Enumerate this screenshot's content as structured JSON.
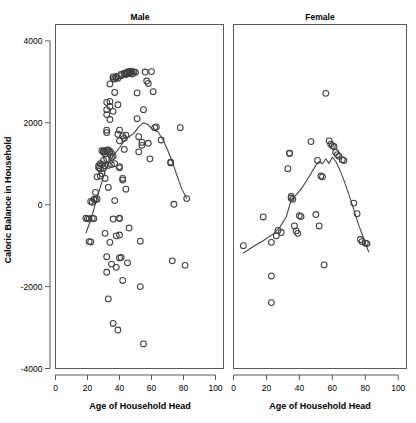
{
  "figure": {
    "background": "#ffffff",
    "ink": "#404040",
    "axis_color": "#5a5a5a",
    "ylabel": "Caloric Balance in Household",
    "panels": [
      {
        "key": "male",
        "title": "Male",
        "xlabel": "Age of Household Head"
      },
      {
        "key": "female",
        "title": "Female",
        "xlabel": "Age of Household Head"
      }
    ]
  },
  "chart_data": {
    "type": "scatter",
    "title": "",
    "xlabel": "Age of Household Head",
    "ylabel": "Caloric Balance in Household",
    "xlim": [
      0,
      105
    ],
    "ylim": [
      -4000,
      4400
    ],
    "xticks": [
      0,
      20,
      40,
      60,
      80,
      100
    ],
    "yticks": [
      4000,
      2000,
      0,
      -2000,
      -4000
    ],
    "xticklabels": [
      "0",
      "20",
      "40",
      "60",
      "80",
      "100"
    ],
    "yticklabels": [
      "4000",
      "2000",
      "0",
      "-2000",
      "-4000"
    ],
    "grid": false,
    "legend": null,
    "marker": "open-circle",
    "overlay": "loess-smoother",
    "panels": [
      {
        "name": "Male",
        "points": [
          [
            19,
            -330
          ],
          [
            20,
            -340
          ],
          [
            21,
            -350
          ],
          [
            21,
            -900
          ],
          [
            22,
            -910
          ],
          [
            22,
            80
          ],
          [
            23,
            60
          ],
          [
            23,
            -330
          ],
          [
            24,
            -340
          ],
          [
            24,
            130
          ],
          [
            25,
            300
          ],
          [
            25,
            120
          ],
          [
            26,
            140
          ],
          [
            26,
            680
          ],
          [
            27,
            900
          ],
          [
            27,
            950
          ],
          [
            28,
            870
          ],
          [
            28,
            700
          ],
          [
            28,
            1000
          ],
          [
            29,
            1320
          ],
          [
            29,
            980
          ],
          [
            29,
            760
          ],
          [
            30,
            1280
          ],
          [
            30,
            1310
          ],
          [
            30,
            900
          ],
          [
            30,
            1080
          ],
          [
            31,
            1300
          ],
          [
            31,
            1240
          ],
          [
            31,
            950
          ],
          [
            31,
            640
          ],
          [
            31,
            -700
          ],
          [
            32,
            1330
          ],
          [
            32,
            1120
          ],
          [
            32,
            1820
          ],
          [
            32,
            1760
          ],
          [
            32,
            2200
          ],
          [
            32,
            2320
          ],
          [
            32,
            2500
          ],
          [
            32,
            -1270
          ],
          [
            32,
            -1650
          ],
          [
            33,
            1340
          ],
          [
            33,
            1290
          ],
          [
            33,
            960
          ],
          [
            33,
            420
          ],
          [
            33,
            -2300
          ],
          [
            34,
            1300
          ],
          [
            34,
            2080
          ],
          [
            34,
            2400
          ],
          [
            34,
            2520
          ],
          [
            34,
            2950
          ],
          [
            34,
            -920
          ],
          [
            35,
            1260
          ],
          [
            35,
            1150
          ],
          [
            35,
            980
          ],
          [
            35,
            -1450
          ],
          [
            36,
            1180
          ],
          [
            36,
            2280
          ],
          [
            36,
            3080
          ],
          [
            36,
            3120
          ],
          [
            36,
            -350
          ],
          [
            36,
            -2900
          ],
          [
            37,
            1000
          ],
          [
            37,
            3070
          ],
          [
            37,
            2740
          ],
          [
            37,
            100
          ],
          [
            38,
            3100
          ],
          [
            38,
            3130
          ],
          [
            38,
            -760
          ],
          [
            38,
            -1530
          ],
          [
            39,
            3090
          ],
          [
            39,
            2440
          ],
          [
            39,
            1720
          ],
          [
            39,
            -3060
          ],
          [
            40,
            1560
          ],
          [
            40,
            1820
          ],
          [
            40,
            930
          ],
          [
            40,
            900
          ],
          [
            40,
            -330
          ],
          [
            40,
            -340
          ],
          [
            40,
            -1300
          ],
          [
            40,
            -740
          ],
          [
            41,
            3150
          ],
          [
            41,
            3180
          ],
          [
            41,
            -1290
          ],
          [
            42,
            1680
          ],
          [
            42,
            640
          ],
          [
            42,
            600
          ],
          [
            42,
            -1850
          ],
          [
            43,
            3190
          ],
          [
            43,
            3210
          ],
          [
            43,
            1620
          ],
          [
            43,
            1350
          ],
          [
            44,
            3180
          ],
          [
            44,
            1700
          ],
          [
            44,
            380
          ],
          [
            45,
            3240
          ],
          [
            45,
            3210
          ],
          [
            45,
            -1420
          ],
          [
            46,
            3250
          ],
          [
            46,
            3200
          ],
          [
            46,
            -570
          ],
          [
            47,
            3230
          ],
          [
            47,
            3260
          ],
          [
            48,
            3250
          ],
          [
            48,
            3190
          ],
          [
            49,
            3240
          ],
          [
            50,
            3230
          ],
          [
            51,
            2100
          ],
          [
            51,
            2730
          ],
          [
            52,
            1660
          ],
          [
            52,
            1290
          ],
          [
            53,
            -890
          ],
          [
            53,
            -2000
          ],
          [
            54,
            1520
          ],
          [
            54,
            1450
          ],
          [
            55,
            2320
          ],
          [
            55,
            -3400
          ],
          [
            56,
            3240
          ],
          [
            57,
            3020
          ],
          [
            58,
            2960
          ],
          [
            58,
            1500
          ],
          [
            59,
            1120
          ],
          [
            60,
            3250
          ],
          [
            61,
            2760
          ],
          [
            62,
            1880
          ],
          [
            63,
            1900
          ],
          [
            66,
            1580
          ],
          [
            72,
            1040
          ],
          [
            72,
            1020
          ],
          [
            73,
            -1370
          ],
          [
            74,
            10
          ],
          [
            78,
            1880
          ],
          [
            81,
            -1480
          ],
          [
            82,
            150
          ]
        ],
        "loess": [
          [
            19,
            -690
          ],
          [
            22,
            -380
          ],
          [
            25,
            30
          ],
          [
            28,
            430
          ],
          [
            31,
            820
          ],
          [
            34,
            1070
          ],
          [
            37,
            1240
          ],
          [
            40,
            1390
          ],
          [
            43,
            1560
          ],
          [
            46,
            1660
          ],
          [
            49,
            1740
          ],
          [
            52,
            1900
          ],
          [
            55,
            2000
          ],
          [
            58,
            1950
          ],
          [
            61,
            1820
          ],
          [
            64,
            1780
          ],
          [
            67,
            1600
          ],
          [
            70,
            1340
          ],
          [
            73,
            1050
          ],
          [
            76,
            700
          ],
          [
            79,
            380
          ],
          [
            82,
            150
          ]
        ]
      },
      {
        "name": "Female",
        "points": [
          [
            6,
            -1000
          ],
          [
            18,
            -300
          ],
          [
            23,
            -920
          ],
          [
            23,
            -1740
          ],
          [
            23,
            -2390
          ],
          [
            26,
            -760
          ],
          [
            27,
            -630
          ],
          [
            29,
            -680
          ],
          [
            33,
            880
          ],
          [
            34,
            1250
          ],
          [
            34,
            1260
          ],
          [
            35,
            160
          ],
          [
            35,
            200
          ],
          [
            36,
            130
          ],
          [
            37,
            -520
          ],
          [
            38,
            -640
          ],
          [
            39,
            -700
          ],
          [
            40,
            -270
          ],
          [
            41,
            -290
          ],
          [
            47,
            1540
          ],
          [
            50,
            -240
          ],
          [
            51,
            1080
          ],
          [
            52,
            -520
          ],
          [
            53,
            700
          ],
          [
            54,
            680
          ],
          [
            55,
            -1470
          ],
          [
            56,
            2720
          ],
          [
            58,
            1560
          ],
          [
            59,
            1480
          ],
          [
            60,
            1440
          ],
          [
            61,
            1420
          ],
          [
            62,
            1280
          ],
          [
            63,
            1220
          ],
          [
            64,
            1180
          ],
          [
            66,
            1100
          ],
          [
            67,
            1080
          ],
          [
            73,
            40
          ],
          [
            75,
            -220
          ],
          [
            77,
            -850
          ],
          [
            78,
            -900
          ],
          [
            80,
            -940
          ],
          [
            81,
            -950
          ]
        ],
        "loess": [
          [
            6,
            -1180
          ],
          [
            12,
            -1020
          ],
          [
            18,
            -880
          ],
          [
            24,
            -720
          ],
          [
            28,
            -560
          ],
          [
            32,
            -300
          ],
          [
            35,
            120
          ],
          [
            38,
            240
          ],
          [
            41,
            380
          ],
          [
            44,
            560
          ],
          [
            47,
            760
          ],
          [
            50,
            960
          ],
          [
            52,
            1060
          ],
          [
            54,
            1000
          ],
          [
            56,
            1120
          ],
          [
            58,
            1010
          ],
          [
            60,
            1160
          ],
          [
            62,
            1060
          ],
          [
            64,
            900
          ],
          [
            67,
            600
          ],
          [
            70,
            250
          ],
          [
            73,
            -120
          ],
          [
            76,
            -500
          ],
          [
            79,
            -820
          ],
          [
            82,
            -1150
          ]
        ]
      }
    ]
  }
}
